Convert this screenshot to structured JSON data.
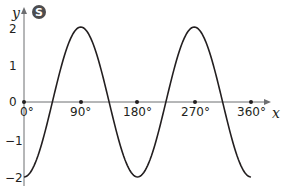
{
  "badge": {
    "letter": "S",
    "color": "#4d4d4f"
  },
  "chart_data": {
    "type": "line",
    "title": "",
    "xlabel": "x",
    "ylabel": "y",
    "x_tick_labels": [
      "0°",
      "90°",
      "180°",
      "270°",
      "360°"
    ],
    "y_tick_labels": [
      "2",
      "1",
      "0",
      "−1",
      "−2"
    ],
    "xlim": [
      0,
      360
    ],
    "ylim": [
      -2,
      2
    ],
    "grid": false,
    "legend": "none",
    "function": "y = -2cos(2x)",
    "series": [
      {
        "name": "curve",
        "x": [
          0,
          45,
          90,
          135,
          180,
          225,
          270,
          315,
          360
        ],
        "y": [
          -2,
          0,
          2,
          0,
          -2,
          0,
          2,
          0,
          -2
        ]
      }
    ]
  }
}
